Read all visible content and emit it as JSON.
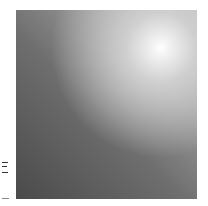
{
  "image": {
    "description": "Grayscale square with gradient shading and a bright glowing spot near the upper-right corner",
    "colors": {
      "dark": "#4a4a4a",
      "mid": "#8a8a8a",
      "highlight": "#ffffff"
    }
  }
}
